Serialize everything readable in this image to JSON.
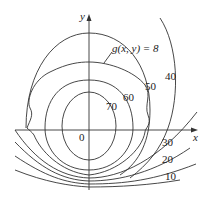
{
  "diagram": {
    "type": "contour-map",
    "axes": {
      "x_label": "x",
      "y_label": "y",
      "origin_label": "0"
    },
    "constraint_label": "g(x, y) = 8",
    "level_labels": {
      "l40": "40",
      "l50": "50",
      "l60": "60",
      "l70": "70",
      "l30": "30",
      "l20": "20",
      "l10": "10"
    }
  }
}
